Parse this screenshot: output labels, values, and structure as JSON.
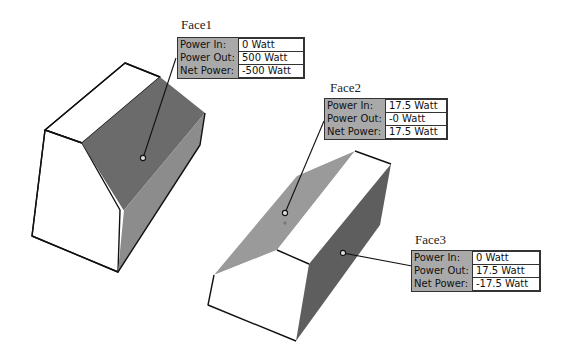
{
  "diagram": {
    "type": "3d-solid-face-power-annotations",
    "colors": {
      "background": "#ffffff",
      "outline": "#111111",
      "face_dark": "#6b6b6b",
      "face_mid": "#8c8c8c",
      "face_light": "#9a9a9a",
      "face_white": "#ffffff",
      "callout_bg": "#a9a9a9",
      "value_bg": "#ffffff"
    },
    "faces": [
      {
        "name": "Face1",
        "rows": [
          {
            "key": "Power In:",
            "value": "0 Watt"
          },
          {
            "key": "Power Out:",
            "value": "500 Watt"
          },
          {
            "key": "Net Power:",
            "value": "-500 Watt"
          }
        ]
      },
      {
        "name": "Face2",
        "rows": [
          {
            "key": "Power In:",
            "value": "17.5 Watt"
          },
          {
            "key": "Power Out:",
            "value": "-0 Watt"
          },
          {
            "key": "Net Power:",
            "value": "17.5 Watt"
          }
        ]
      },
      {
        "name": "Face3",
        "rows": [
          {
            "key": "Power In:",
            "value": "0 Watt"
          },
          {
            "key": "Power Out:",
            "value": "17.5 Watt"
          },
          {
            "key": "Net Power:",
            "value": "-17.5 Watt"
          }
        ]
      }
    ]
  }
}
